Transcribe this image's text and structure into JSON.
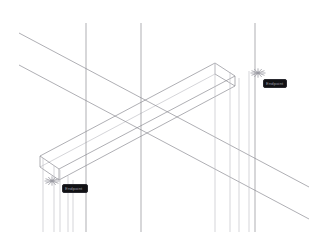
{
  "viewport": {
    "name": "cad-wireframe-viewport",
    "background_color": "#ffffff",
    "width": 319,
    "height": 244,
    "line_color": "#8c8c94",
    "line_color_dark": "#6e6e77",
    "line_color_light": "#b9b9c0"
  },
  "snap_markers": [
    {
      "name": "snap-point-left",
      "glyph": "✳",
      "x": 52,
      "y": 181,
      "color": "#9a9aa2"
    },
    {
      "name": "snap-point-right",
      "glyph": "✳",
      "x": 258,
      "y": 73,
      "color": "#9a9aa2"
    }
  ],
  "tooltips": [
    {
      "name": "snap-tooltip-right",
      "text": "Endpoint",
      "background_color": "#111114",
      "text_color": "#9a9aa2",
      "x": 263,
      "y": 79
    },
    {
      "name": "snap-tooltip-left",
      "text": "Endpoint",
      "background_color": "#111114",
      "text_color": "#9a9aa2",
      "x": 62,
      "y": 184
    }
  ],
  "chart_data": {
    "type": "line",
    "title": "",
    "xlabel": "",
    "ylabel": "",
    "grid": false,
    "legend": "none",
    "xlim": [
      0,
      319
    ],
    "ylim": [
      0,
      244
    ],
    "series": [
      {
        "name": "beam-top-face-long-edge-back",
        "color": "#8c8c94",
        "width": 0.7,
        "points": [
          [
            40,
            156
          ],
          [
            215,
            63
          ]
        ]
      },
      {
        "name": "beam-top-face-long-edge-front",
        "color": "#8c8c94",
        "width": 0.7,
        "points": [
          [
            59,
            169
          ],
          [
            235,
            76
          ]
        ]
      },
      {
        "name": "beam-bottom-long-edge-front",
        "color": "#8c8c94",
        "width": 0.7,
        "points": [
          [
            59,
            180
          ],
          [
            235,
            86
          ]
        ]
      },
      {
        "name": "beam-bottom-long-edge-back",
        "color": "#b9b9c0",
        "width": 0.6,
        "points": [
          [
            40,
            167
          ],
          [
            215,
            74
          ]
        ]
      },
      {
        "name": "beam-left-end-top-edge",
        "color": "#8c8c94",
        "width": 0.7,
        "points": [
          [
            40,
            156
          ],
          [
            59,
            169
          ]
        ]
      },
      {
        "name": "beam-left-end-bottom-edge",
        "color": "#8c8c94",
        "width": 0.7,
        "points": [
          [
            40,
            167
          ],
          [
            59,
            180
          ]
        ]
      },
      {
        "name": "beam-left-end-vertical-back",
        "color": "#8c8c94",
        "width": 0.7,
        "points": [
          [
            40,
            156
          ],
          [
            40,
            167
          ]
        ]
      },
      {
        "name": "beam-left-end-vertical-front",
        "color": "#8c8c94",
        "width": 0.7,
        "points": [
          [
            59,
            169
          ],
          [
            59,
            180
          ]
        ]
      },
      {
        "name": "beam-right-end-top-edge",
        "color": "#8c8c94",
        "width": 0.7,
        "points": [
          [
            215,
            63
          ],
          [
            235,
            76
          ]
        ]
      },
      {
        "name": "beam-right-end-bottom-edge",
        "color": "#8c8c94",
        "width": 0.7,
        "points": [
          [
            215,
            74
          ],
          [
            235,
            86
          ]
        ]
      },
      {
        "name": "beam-right-end-vertical-back",
        "color": "#b9b9c0",
        "width": 0.6,
        "points": [
          [
            215,
            63
          ],
          [
            215,
            74
          ]
        ]
      },
      {
        "name": "beam-right-end-vertical-front",
        "color": "#8c8c94",
        "width": 0.7,
        "points": [
          [
            235,
            76
          ],
          [
            235,
            86
          ]
        ]
      },
      {
        "name": "construction-line-upper",
        "color": "#8c8c94",
        "width": 0.7,
        "points": [
          [
            19,
            33
          ],
          [
            309,
            187
          ]
        ]
      },
      {
        "name": "construction-line-lower",
        "color": "#8c8c94",
        "width": 0.7,
        "points": [
          [
            19,
            65
          ],
          [
            309,
            219
          ]
        ]
      },
      {
        "name": "extension-vertical-1",
        "color": "#8c8c94",
        "width": 0.7,
        "points": [
          [
            86,
            23
          ],
          [
            86,
            232
          ]
        ]
      },
      {
        "name": "extension-vertical-2",
        "color": "#8c8c94",
        "width": 0.7,
        "points": [
          [
            141,
            23
          ],
          [
            141,
            232
          ]
        ]
      },
      {
        "name": "extension-vertical-3",
        "color": "#8c8c94",
        "width": 0.7,
        "points": [
          [
            255,
            23
          ],
          [
            255,
            232
          ]
        ]
      },
      {
        "name": "extension-vertical-4",
        "color": "#b9b9c0",
        "width": 0.6,
        "points": [
          [
            215,
            63
          ],
          [
            215,
            232
          ]
        ]
      },
      {
        "name": "extension-vertical-5",
        "color": "#b9b9c0",
        "width": 0.6,
        "points": [
          [
            230,
            72
          ],
          [
            230,
            232
          ]
        ]
      },
      {
        "name": "extension-vertical-6",
        "color": "#b9b9c0",
        "width": 0.6,
        "points": [
          [
            239,
            78
          ],
          [
            239,
            232
          ]
        ]
      },
      {
        "name": "extension-vertical-7",
        "color": "#b9b9c0",
        "width": 0.6,
        "points": [
          [
            249,
            71
          ],
          [
            249,
            232
          ]
        ]
      },
      {
        "name": "extension-vertical-8",
        "color": "#b9b9c0",
        "width": 0.6,
        "points": [
          [
            43,
            158
          ],
          [
            43,
            232
          ]
        ]
      },
      {
        "name": "extension-vertical-9",
        "color": "#b9b9c0",
        "width": 0.6,
        "points": [
          [
            54,
            166
          ],
          [
            54,
            232
          ]
        ]
      },
      {
        "name": "extension-vertical-10",
        "color": "#b9b9c0",
        "width": 0.6,
        "points": [
          [
            60,
            170
          ],
          [
            60,
            232
          ]
        ]
      },
      {
        "name": "extension-vertical-11",
        "color": "#b9b9c0",
        "width": 0.6,
        "points": [
          [
            68,
            176
          ],
          [
            68,
            232
          ]
        ]
      },
      {
        "name": "extension-vertical-12",
        "color": "#b9b9c0",
        "width": 0.6,
        "points": [
          [
            73,
            180
          ],
          [
            73,
            232
          ]
        ]
      }
    ]
  }
}
